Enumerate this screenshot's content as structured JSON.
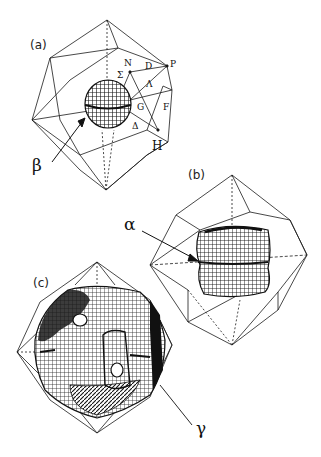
{
  "figure": {
    "panels": [
      {
        "id": "a",
        "label": "(a)",
        "pocket_label": "β",
        "description": "Brillouin zone wireframe with small spherical mesh surface at center",
        "high_symmetry_points": {
          "N": "N",
          "D": "D",
          "P": "P",
          "Sigma": "Σ",
          "Lambda": "Λ",
          "G": "G",
          "F": "F",
          "Delta": "Δ",
          "H": "H"
        }
      },
      {
        "id": "b",
        "label": "(b)",
        "pocket_label": "α",
        "description": "Brillouin zone wireframe with cube-like mesh surface at center"
      },
      {
        "id": "c",
        "label": "(c)",
        "pocket_label": "γ",
        "description": "Brillouin zone wireframe filled by large mesh surface with holes"
      }
    ]
  },
  "colors": {
    "line": "#1a1a1a",
    "mesh": "#111111",
    "background": "#ffffff"
  }
}
